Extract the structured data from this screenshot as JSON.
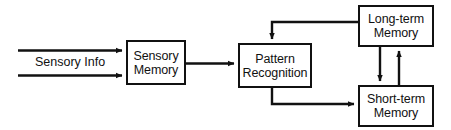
{
  "diagram": {
    "type": "flowchart",
    "background_color": "#ffffff",
    "stroke_color": "#111111",
    "nodes": [
      {
        "id": "sensory-memory",
        "line1": "Sensory",
        "line2": "Memory"
      },
      {
        "id": "pattern-recognition",
        "line1": "Pattern",
        "line2": "Recognition"
      },
      {
        "id": "long-term-memory",
        "line1": "Long-term",
        "line2": "Memory"
      },
      {
        "id": "short-term-memory",
        "line1": "Short-term",
        "line2": "Memory"
      }
    ],
    "edges": [
      {
        "id": "input-upper",
        "label": "",
        "from": "input",
        "to": "sensory-memory"
      },
      {
        "id": "input-lower",
        "label": "",
        "from": "input",
        "to": "sensory-memory"
      },
      {
        "id": "sensory-to-pattern",
        "label": "",
        "from": "sensory-memory",
        "to": "pattern-recognition"
      },
      {
        "id": "longterm-to-pattern",
        "label": "",
        "from": "long-term-memory",
        "to": "pattern-recognition"
      },
      {
        "id": "pattern-to-shortterm",
        "label": "",
        "from": "pattern-recognition",
        "to": "short-term-memory"
      },
      {
        "id": "longterm-to-shortterm",
        "label": "",
        "from": "long-term-memory",
        "to": "short-term-memory"
      },
      {
        "id": "shortterm-to-longterm",
        "label": "",
        "from": "short-term-memory",
        "to": "long-term-memory"
      }
    ],
    "labels": {
      "sensory_info": "Sensory Info"
    }
  }
}
